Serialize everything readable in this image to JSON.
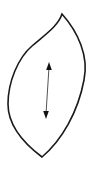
{
  "figure": {
    "canvas": {
      "width": 95,
      "height": 176,
      "background_color": "#ffffff"
    },
    "shape": {
      "name": "leaf-outline",
      "kind": "closed-curve",
      "stroke_color": "#1a1a1a",
      "stroke_width": 1.6,
      "fill": "none",
      "top_cusp": {
        "x": 62,
        "y": 14
      },
      "bottom_cusp": {
        "x": 42,
        "y": 157
      },
      "leftmost_point": {
        "x": 8,
        "y": 104
      },
      "rightmost_point": {
        "x": 84,
        "y": 64
      },
      "path": "M 62 14 C 58 26 46 34 32 46 C 18 58 8 82 8 104 C 8 124 22 142 42 157 C 62 140 78 112 84 80 C 89 56 78 32 62 14 Z"
    },
    "arrow": {
      "name": "double-headed-dimension-arrow",
      "direction": "vertical",
      "heads": 2,
      "shaft_color": "#555555",
      "head_color": "#111111",
      "shaft_width": 1,
      "start": {
        "x": 49,
        "y": 63
      },
      "end": {
        "x": 46,
        "y": 118
      },
      "length_px": 55,
      "head_top_path": "M 49 62 L 46.2 70 L 51.8 70 Z",
      "head_bottom_path": "M 46 119 L 43.2 111 L 48.8 111 Z",
      "shaft_x1": 49,
      "shaft_y1": 67,
      "shaft_x2": 46,
      "shaft_y2": 114
    }
  }
}
